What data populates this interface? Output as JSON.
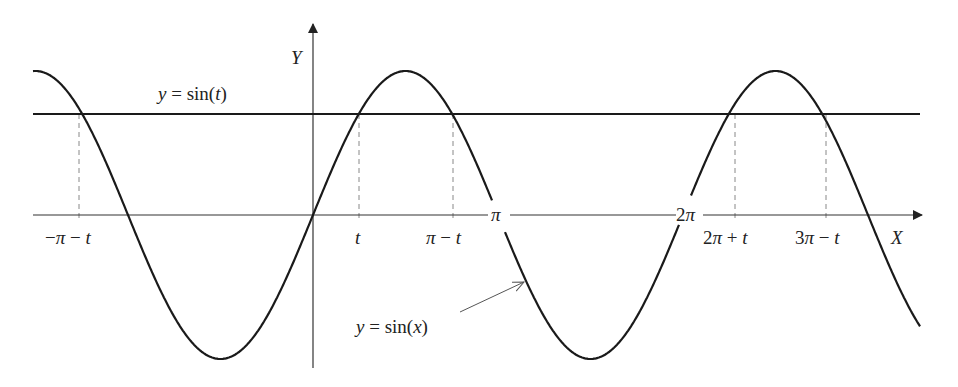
{
  "figure": {
    "type": "function-plot",
    "axes": {
      "x_label": "X",
      "y_label": "Y"
    },
    "curves": [
      {
        "name": "sine-curve",
        "label": "y = sin(x)",
        "label_parts": [
          "y",
          " = sin(",
          "x",
          ")"
        ]
      },
      {
        "name": "horizontal-line",
        "label": "y = sin(t)",
        "label_parts": [
          "y",
          " = sin(",
          "t",
          ")"
        ]
      }
    ],
    "x_tick_labels": [
      {
        "text": "−π − t",
        "parts": [
          "−",
          "π",
          " − ",
          "t"
        ]
      },
      {
        "text": "t"
      },
      {
        "text": "π − t",
        "parts": [
          "π",
          " − ",
          "t"
        ]
      },
      {
        "text": "π"
      },
      {
        "text": "2π"
      },
      {
        "text": "2π + t",
        "parts": [
          "2",
          "π",
          " + ",
          "t"
        ]
      },
      {
        "text": "3π − t",
        "parts": [
          "3",
          "π",
          " − ",
          "t"
        ]
      }
    ],
    "colors": {
      "curve": "#1a1a1a",
      "axis": "#333333",
      "dashed": "#888888",
      "background": "#ffffff"
    }
  },
  "chart_data": {
    "type": "line",
    "title": "",
    "xlabel": "X",
    "ylabel": "Y",
    "series": [
      {
        "name": "y = sin(x)",
        "function": "sin(x)",
        "x_range": [
          "-π - 1.7",
          "3π + 0.9"
        ]
      },
      {
        "name": "y = sin(t)",
        "function": "constant ≈ 0.70"
      }
    ],
    "marked_points": [
      "-π - t",
      "t",
      "π - t",
      "2π + t",
      "3π - t"
    ],
    "axis_ticks": [
      "π",
      "2π"
    ],
    "grid": false,
    "legend": "none (inline labels)"
  }
}
